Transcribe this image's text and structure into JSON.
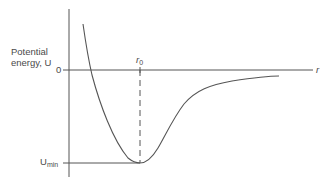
{
  "diagram": {
    "y_axis_label_line1": "Potential",
    "y_axis_label_line2": "energy, U",
    "zero_label": "0",
    "x_axis_label": "r",
    "r0_label_main": "r",
    "r0_label_sub": "0",
    "umin_label_main": "U",
    "umin_label_sub": "min",
    "colors": {
      "line": "#555555",
      "text": "#4a4a4a",
      "background": "#ffffff"
    }
  }
}
